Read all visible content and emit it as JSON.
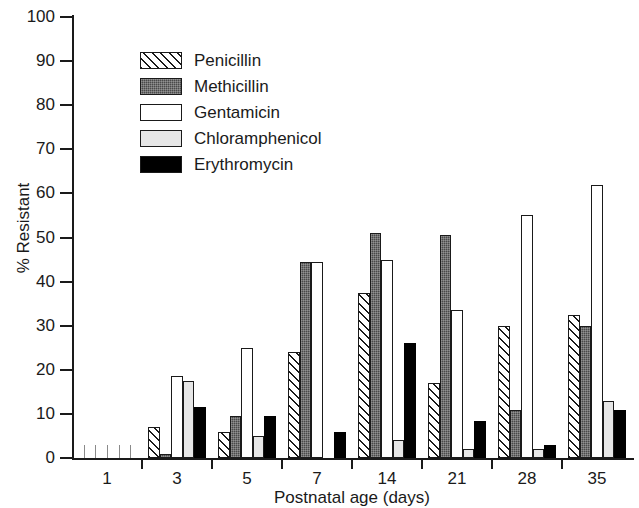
{
  "chart_data": {
    "type": "bar",
    "title": "",
    "subtitle": "",
    "xlabel": "Postnatal age (days)",
    "ylabel": "% Resistant",
    "categories": [
      "1",
      "3",
      "5",
      "7",
      "14",
      "21",
      "28",
      "35"
    ],
    "ylim": [
      0,
      100
    ],
    "ytick_labels": [
      "0",
      "10",
      "20",
      "30",
      "40",
      "50",
      "60",
      "70",
      "80",
      "90",
      "100"
    ],
    "ytick_values": [
      0,
      10,
      20,
      30,
      40,
      50,
      60,
      70,
      80,
      90,
      100
    ],
    "grid": false,
    "legend_position": "upper-left-inside",
    "series": [
      {
        "name": "Penicillin",
        "pattern": "diagonal-hatch",
        "color": "#ffffff",
        "values": [
          0,
          7,
          6,
          24,
          37.5,
          17,
          30,
          32.5
        ]
      },
      {
        "name": "Methicillin",
        "pattern": "dark-stipple",
        "color": "#4a4a4a",
        "values": [
          0,
          1,
          9.5,
          44.5,
          51,
          50.5,
          11,
          30
        ]
      },
      {
        "name": "Gentamicin",
        "pattern": "solid-white",
        "color": "#ffffff",
        "values": [
          0,
          18.5,
          25,
          44.5,
          45,
          33.5,
          55,
          62
        ]
      },
      {
        "name": "Chloramphenicol",
        "pattern": "solid-light-gray",
        "color": "#e6e6e6",
        "values": [
          0,
          17.5,
          5,
          0,
          4,
          2,
          2,
          13
        ]
      },
      {
        "name": "Erythromycin",
        "pattern": "solid-black",
        "color": "#000000",
        "values": [
          0,
          11.5,
          9.5,
          6,
          26,
          8.5,
          3,
          11
        ]
      }
    ]
  },
  "axes": {
    "y_title": "% Resistant",
    "x_title": "Postnatal age (days)"
  }
}
